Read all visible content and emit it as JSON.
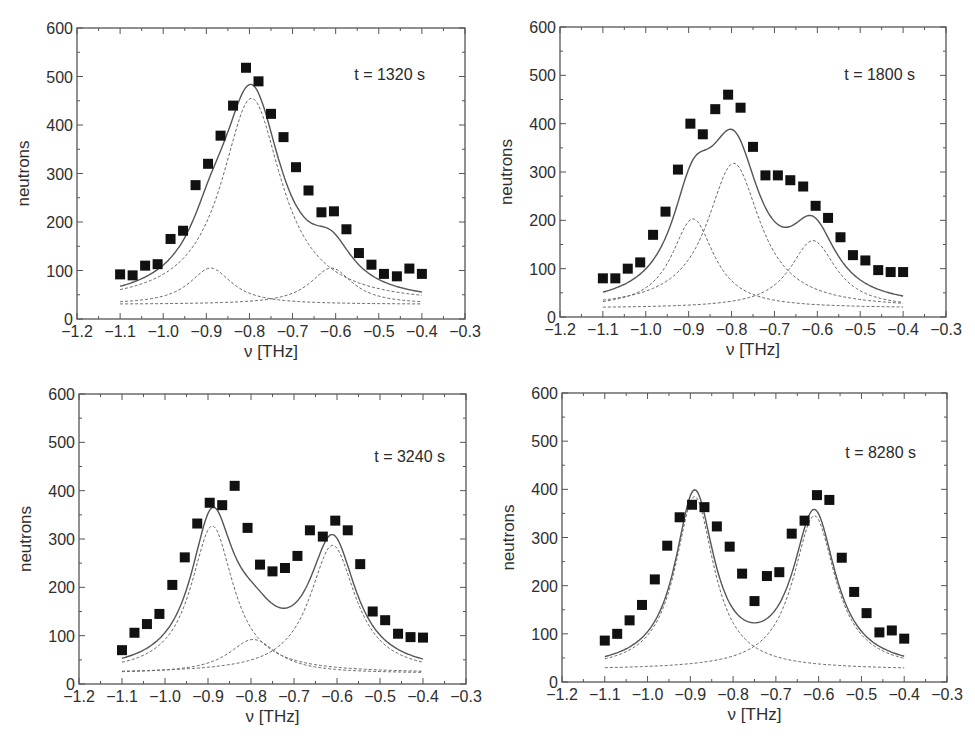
{
  "figure": {
    "colors": {
      "frame": "#555555",
      "marker": "#111111",
      "fit": "#555555",
      "component": "#666666"
    }
  },
  "chart_data": [
    {
      "type": "scatter",
      "panel": "top-left",
      "annotation": "t = 1320 s",
      "xlabel": "ν [THz]",
      "ylabel": "neutrons",
      "xlim": [
        -1.2,
        -0.3
      ],
      "ylim": [
        0,
        600
      ],
      "xticks": [
        "−1.2",
        "−1.1",
        "−1.0",
        "−0.9",
        "−0.8",
        "−0.7",
        "−0.6",
        "−0.5",
        "−0.4",
        "−0.3"
      ],
      "yticks": [
        "0",
        "100",
        "200",
        "300",
        "400",
        "500",
        "600"
      ],
      "grid": false,
      "frame_px": {
        "left": 77,
        "top": 28,
        "right": 465,
        "bottom": 319
      },
      "annotation_px": {
        "x": 425,
        "y": 80
      },
      "x": [
        -1.1,
        -1.071,
        -1.042,
        -1.013,
        -0.983,
        -0.954,
        -0.925,
        -0.896,
        -0.867,
        -0.838,
        -0.808,
        -0.779,
        -0.75,
        -0.721,
        -0.692,
        -0.663,
        -0.633,
        -0.604,
        -0.575,
        -0.546,
        -0.517,
        -0.488,
        -0.458,
        -0.429,
        -0.4
      ],
      "series": [
        {
          "name": "data",
          "style": "markers",
          "values": [
            92,
            90,
            110,
            113,
            165,
            182,
            276,
            320,
            378,
            440,
            518,
            490,
            423,
            375,
            313,
            265,
            220,
            222,
            185,
            136,
            112,
            93,
            88,
            104,
            93
          ]
        }
      ],
      "fit": {
        "background": 30,
        "components": [
          {
            "name": "central mode",
            "center": -0.795,
            "amplitude": 425,
            "hwhm": 0.085
          },
          {
            "name": "lower mode",
            "center": -0.89,
            "amplitude": 75,
            "hwhm": 0.06
          },
          {
            "name": "upper mode",
            "center": -0.61,
            "amplitude": 75,
            "hwhm": 0.06
          }
        ]
      }
    },
    {
      "type": "scatter",
      "panel": "top-right",
      "annotation": "t = 1800 s",
      "xlabel": "ν [THz]",
      "ylabel": "neutrons",
      "xlim": [
        -1.2,
        -0.3
      ],
      "ylim": [
        0,
        600
      ],
      "xticks": [
        "−1.2",
        "−1.1",
        "−1.0",
        "−0.9",
        "−0.8",
        "−0.7",
        "−0.6",
        "−0.5",
        "−0.4",
        "−0.3"
      ],
      "yticks": [
        "0",
        "100",
        "200",
        "300",
        "400",
        "500",
        "600"
      ],
      "grid": false,
      "frame_px": {
        "left": 560,
        "top": 27,
        "right": 946,
        "bottom": 317
      },
      "annotation_px": {
        "x": 915,
        "y": 80
      },
      "x": [
        -1.1,
        -1.071,
        -1.042,
        -1.013,
        -0.983,
        -0.954,
        -0.925,
        -0.896,
        -0.867,
        -0.838,
        -0.808,
        -0.779,
        -0.75,
        -0.721,
        -0.692,
        -0.663,
        -0.633,
        -0.604,
        -0.575,
        -0.546,
        -0.517,
        -0.488,
        -0.458,
        -0.429,
        -0.4
      ],
      "series": [
        {
          "name": "data",
          "style": "markers",
          "values": [
            80,
            80,
            100,
            113,
            170,
            218,
            305,
            400,
            378,
            430,
            460,
            433,
            352,
            293,
            293,
            283,
            270,
            230,
            205,
            165,
            128,
            117,
            97,
            93,
            93
          ]
        }
      ],
      "fit": {
        "background": 18,
        "components": [
          {
            "name": "central mode",
            "center": -0.795,
            "amplitude": 300,
            "hwhm": 0.075
          },
          {
            "name": "lower mode",
            "center": -0.89,
            "amplitude": 185,
            "hwhm": 0.06
          },
          {
            "name": "upper mode",
            "center": -0.61,
            "amplitude": 140,
            "hwhm": 0.065
          }
        ]
      }
    },
    {
      "type": "scatter",
      "panel": "bottom-left",
      "annotation": "t = 3240 s",
      "xlabel": "ν [THz]",
      "ylabel": "neutrons",
      "xlim": [
        -1.2,
        -0.3
      ],
      "ylim": [
        0,
        600
      ],
      "xticks": [
        "−1.2",
        "−1.1",
        "−1.0",
        "−0.9",
        "−0.8",
        "−0.7",
        "−0.6",
        "−0.5",
        "−0.4",
        "−0.3"
      ],
      "yticks": [
        "0",
        "100",
        "200",
        "300",
        "400",
        "500",
        "600"
      ],
      "grid": false,
      "frame_px": {
        "left": 79,
        "top": 394,
        "right": 466,
        "bottom": 684
      },
      "annotation_px": {
        "x": 445,
        "y": 462
      },
      "x": [
        -1.1,
        -1.071,
        -1.042,
        -1.013,
        -0.983,
        -0.954,
        -0.925,
        -0.896,
        -0.867,
        -0.838,
        -0.808,
        -0.779,
        -0.75,
        -0.721,
        -0.692,
        -0.663,
        -0.633,
        -0.604,
        -0.575,
        -0.546,
        -0.517,
        -0.488,
        -0.458,
        -0.429,
        -0.4
      ],
      "series": [
        {
          "name": "data",
          "style": "markers",
          "values": [
            70,
            106,
            124,
            145,
            205,
            262,
            332,
            375,
            370,
            410,
            323,
            247,
            233,
            240,
            265,
            318,
            305,
            338,
            318,
            248,
            150,
            132,
            104,
            97,
            96
          ]
        }
      ],
      "fit": {
        "background": 22,
        "components": [
          {
            "name": "lower mode",
            "center": -0.89,
            "amplitude": 305,
            "hwhm": 0.06
          },
          {
            "name": "central mode",
            "center": -0.795,
            "amplitude": 70,
            "hwhm": 0.07
          },
          {
            "name": "upper mode",
            "center": -0.61,
            "amplitude": 265,
            "hwhm": 0.065
          }
        ]
      }
    },
    {
      "type": "scatter",
      "panel": "bottom-right",
      "annotation": "t = 8280 s",
      "xlabel": "ν [THz]",
      "ylabel": "neutrons",
      "xlim": [
        -1.2,
        -0.3
      ],
      "ylim": [
        0,
        600
      ],
      "xticks": [
        "−1.2",
        "−1.1",
        "−1.0",
        "−0.9",
        "−0.8",
        "−0.7",
        "−0.6",
        "−0.5",
        "−0.4",
        "−0.3"
      ],
      "yticks": [
        "0",
        "100",
        "200",
        "300",
        "400",
        "500",
        "600"
      ],
      "grid": false,
      "frame_px": {
        "left": 562,
        "top": 393,
        "right": 947,
        "bottom": 682
      },
      "annotation_px": {
        "x": 916,
        "y": 458
      },
      "x": [
        -1.1,
        -1.071,
        -1.042,
        -1.013,
        -0.983,
        -0.954,
        -0.925,
        -0.896,
        -0.867,
        -0.838,
        -0.808,
        -0.779,
        -0.75,
        -0.721,
        -0.692,
        -0.663,
        -0.633,
        -0.604,
        -0.575,
        -0.546,
        -0.517,
        -0.488,
        -0.458,
        -0.429,
        -0.4
      ],
      "series": [
        {
          "name": "data",
          "style": "markers",
          "values": [
            86,
            100,
            128,
            160,
            213,
            283,
            342,
            368,
            363,
            323,
            281,
            225,
            168,
            220,
            228,
            308,
            335,
            388,
            378,
            258,
            187,
            143,
            103,
            107,
            90
          ]
        }
      ],
      "fit": {
        "background": 25,
        "components": [
          {
            "name": "lower mode",
            "center": -0.89,
            "amplitude": 360,
            "hwhm": 0.055
          },
          {
            "name": "upper mode",
            "center": -0.61,
            "amplitude": 320,
            "hwhm": 0.06
          }
        ]
      }
    }
  ]
}
